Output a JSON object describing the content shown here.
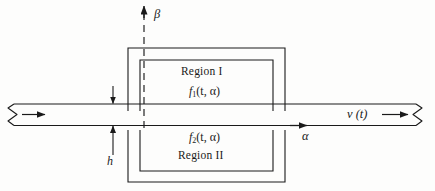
{
  "figure": {
    "stroke_color": "#1a1a1a",
    "background_color": "#fdfdfc"
  },
  "axes": {
    "vertical": {
      "label": "β",
      "name": "beta-axis",
      "style": "dashed",
      "direction": "up"
    },
    "horizontal": {
      "label": "α",
      "name": "alpha-axis",
      "style": "dashed",
      "direction": "right"
    }
  },
  "regions": [
    {
      "name": "region-one",
      "label": "Region I",
      "function": {
        "symbol": "f",
        "subscript": "1",
        "args": "(t, α)",
        "full": "f₁(t, α)"
      }
    },
    {
      "name": "region-two",
      "label": "Region II",
      "function": {
        "symbol": "f",
        "subscript": "2",
        "args": "(t, α)",
        "full": "f₂(t, α)"
      }
    }
  ],
  "dimensions": {
    "thickness_label": "h",
    "thickness_name": "strip-thickness-h"
  },
  "velocity": {
    "label": "v (t)",
    "name": "velocity-label"
  },
  "flow": {
    "inlet_arrow": "flow-direction-arrow-left",
    "outlet_arrow": "flow-direction-arrow-right"
  }
}
